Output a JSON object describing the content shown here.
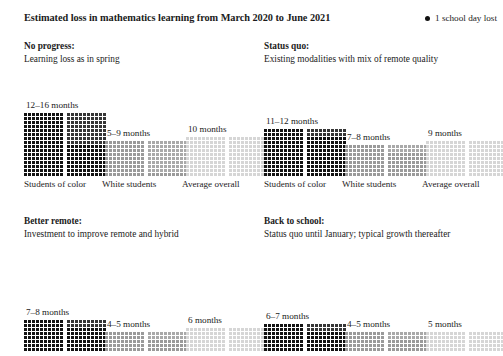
{
  "header": {
    "title": "Estimated loss in mathematics learning from March 2020 to June 2021",
    "legend_label": "1 school day lost",
    "legend_icon": "filled-circle-icon"
  },
  "colors": {
    "dark": "#121212",
    "medium": "#9a9a9a",
    "light": "#d6d6d6",
    "text": "#1b1b1b",
    "background": "#ffffff"
  },
  "categories": [
    "Students of color",
    "White students",
    "Average overall"
  ],
  "chart_data": {
    "type": "bar",
    "title": "Estimated loss in mathematics learning from March 2020 to June 2021",
    "unit": "months of learning loss",
    "dot_unit": "1 school day lost",
    "xlabel": "",
    "ylabel": "months",
    "categories": [
      "Students of color",
      "White students",
      "Average overall"
    ],
    "panels": [
      {
        "name": "No progress",
        "title": "No progress:",
        "subtitle": "Learning loss as in spring",
        "values": [
          {
            "category": "Students of color",
            "label": "12–16 months",
            "low": 12,
            "high": 16,
            "shade": "dark"
          },
          {
            "category": "White students",
            "label": "5–9 months",
            "low": 5,
            "high": 9,
            "shade": "medium"
          },
          {
            "category": "Average overall",
            "label": "10 months",
            "low": 10,
            "high": 10,
            "shade": "light"
          }
        ]
      },
      {
        "name": "Status quo",
        "title": "Status quo:",
        "subtitle": "Existing modalities with mix of remote quality",
        "values": [
          {
            "category": "Students of color",
            "label": "11–12 months",
            "low": 11,
            "high": 12,
            "shade": "dark"
          },
          {
            "category": "White students",
            "label": "7–8 months",
            "low": 7,
            "high": 8,
            "shade": "medium"
          },
          {
            "category": "Average overall",
            "label": "9 months",
            "low": 9,
            "high": 9,
            "shade": "light"
          }
        ]
      },
      {
        "name": "Better remote",
        "title": "Better remote:",
        "subtitle": "Investment to improve remote and hybrid",
        "values": [
          {
            "category": "Students of color",
            "label": "7–8 months",
            "low": 7,
            "high": 8,
            "shade": "dark"
          },
          {
            "category": "White students",
            "label": "4–5 months",
            "low": 4,
            "high": 5,
            "shade": "medium"
          },
          {
            "category": "Average overall",
            "label": "6 months",
            "low": 6,
            "high": 6,
            "shade": "light"
          }
        ]
      },
      {
        "name": "Back to school",
        "title": "Back to school:",
        "subtitle": "Status quo until January; typical growth thereafter",
        "values": [
          {
            "category": "Students of color",
            "label": "6–7 months",
            "low": 6,
            "high": 7,
            "shade": "dark"
          },
          {
            "category": "White students",
            "label": "4–5 months",
            "low": 4,
            "high": 5,
            "shade": "medium"
          },
          {
            "category": "Average overall",
            "label": "5 months",
            "low": 5,
            "high": 5,
            "shade": "light"
          }
        ]
      }
    ]
  }
}
